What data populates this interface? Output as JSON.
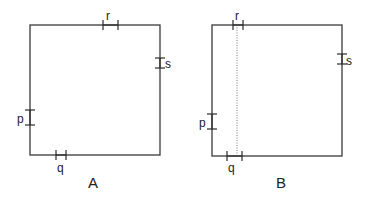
{
  "figures": [
    {
      "id": "A",
      "caption": "A",
      "square": {
        "x1": 30,
        "y1": 25,
        "x2": 160,
        "y2": 155
      },
      "marks": [
        {
          "label": "r",
          "edge": "top",
          "from": 103,
          "to": 118,
          "lx": 106,
          "ly": 20
        },
        {
          "label": "s",
          "edge": "right",
          "from": 58,
          "to": 68,
          "lx": 165,
          "ly": 68
        },
        {
          "label": "p",
          "edge": "left",
          "from": 110,
          "to": 125,
          "lx": 17,
          "ly": 123
        },
        {
          "label": "q",
          "edge": "bottom",
          "from": 56,
          "to": 66,
          "lx": 57,
          "ly": 172
        }
      ],
      "dotted_line": null,
      "caption_pos": {
        "x": 88,
        "y": 188
      }
    },
    {
      "id": "B",
      "caption": "B",
      "square": {
        "x1": 212,
        "y1": 25,
        "x2": 342,
        "y2": 156
      },
      "marks": [
        {
          "label": "r",
          "edge": "top",
          "from": 233,
          "to": 243,
          "lx": 235,
          "ly": 20
        },
        {
          "label": "s",
          "edge": "right",
          "from": 54,
          "to": 64,
          "lx": 346,
          "ly": 65
        },
        {
          "label": "p",
          "edge": "left",
          "from": 114,
          "to": 129,
          "lx": 199,
          "ly": 127
        },
        {
          "label": "q",
          "edge": "bottom",
          "from": 227,
          "to": 242,
          "lx": 228,
          "ly": 172
        }
      ],
      "dotted_line": {
        "x": 237
      },
      "caption_pos": {
        "x": 276,
        "y": 188
      }
    }
  ]
}
